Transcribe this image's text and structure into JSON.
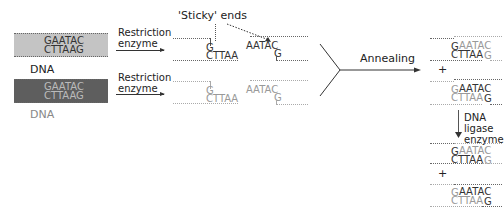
{
  "dna_top": {
    "label": "DNA",
    "top_strand": "GAATAC",
    "bottom_strand": "CTTAAG",
    "fill": "#c4c4c4"
  },
  "dna_bottom": {
    "label": "DNA",
    "top_strand": "GAATAC",
    "bottom_strand": "CTTAAG",
    "fill": "#5e5e5e"
  },
  "step1": {
    "label_line1": "Restriction",
    "label_line2": "enzyme"
  },
  "step2": {
    "label_line1": "Restriction",
    "label_line2": "enzyme"
  },
  "sticky_ends_label": "'Sticky' ends",
  "fragments": {
    "row1_left": {
      "top": "G",
      "bottom": "CTTAA"
    },
    "row1_right": {
      "top": "AATAC",
      "bottom": "G"
    },
    "row2_left": {
      "top": "G",
      "bottom": "CTTAA"
    },
    "row2_right": {
      "top": "AATAC",
      "bottom": "G"
    }
  },
  "annealing_label": "Annealing",
  "annealed": {
    "a": {
      "top_g": "G",
      "top_rest": "AATAC",
      "bot_rest": "CTTAA",
      "bot_g": "G"
    },
    "plus": "+",
    "b": {
      "top_g": "G",
      "top_rest": "AATAC",
      "bot_rest": "CTTAA",
      "bot_g": "G"
    }
  },
  "ligase": {
    "label_line1": "DNA ligase",
    "label_line2": "enzyme"
  },
  "ligated": {
    "a": {
      "top_g": "G",
      "top_rest": "AATAC",
      "bot_rest": "CTTAA",
      "bot_g": "G"
    },
    "plus": "+",
    "b": {
      "top_g": "G",
      "top_rest": "AATAC",
      "bot_rest": "CTTAA",
      "bot_g": "G"
    }
  }
}
